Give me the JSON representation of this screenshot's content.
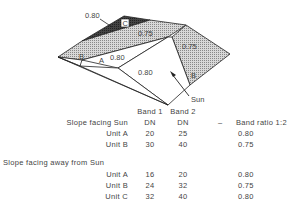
{
  "diagram": {
    "ratio_labels": {
      "top_left": "0.80",
      "top_face": "0.75",
      "right_face": "0.75",
      "small_face_a": "0.80",
      "front_face": "0.80"
    },
    "unit_labels": {
      "c": "C",
      "b_left": "B",
      "a": "A",
      "b_right": "B"
    },
    "sun_label": "Sun"
  },
  "table": {
    "headers": {
      "band1_line1": "Band 1",
      "band2_line1": "Band 2",
      "band1_line2": "DN",
      "band2_line2": "DN",
      "dash": "–",
      "ratio": "Band ratio 1:2"
    },
    "groups": [
      {
        "title": "Slope facing Sun",
        "rows": [
          {
            "unit": "Unit A",
            "band1": "20",
            "band2": "25",
            "ratio": "0.80"
          },
          {
            "unit": "Unit B",
            "band1": "30",
            "band2": "40",
            "ratio": "0.75"
          }
        ]
      },
      {
        "title": "Slope facing away from Sun",
        "rows": [
          {
            "unit": "Unit A",
            "band1": "16",
            "band2": "20",
            "ratio": "0.80"
          },
          {
            "unit": "Unit B",
            "band1": "24",
            "band2": "32",
            "ratio": "0.75"
          },
          {
            "unit": "Unit C",
            "band1": "32",
            "band2": "40",
            "ratio": "0.80"
          }
        ]
      }
    ]
  }
}
